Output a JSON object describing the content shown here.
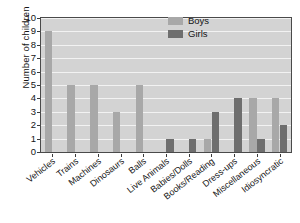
{
  "chart_data": {
    "type": "bar",
    "title": "",
    "xlabel": "",
    "ylabel": "Number of children",
    "ylim": [
      0,
      10
    ],
    "ytick_labels": [
      "0",
      "1",
      "2",
      "3",
      "4",
      "5",
      "6",
      "7",
      "8",
      "9",
      "10"
    ],
    "grid": true,
    "legend_position": "top-right",
    "categories": [
      "Vehicles",
      "Trains",
      "Machines",
      "Dinosaurs",
      "Balls",
      "Live Animals",
      "Babies/Dolls",
      "Books/Reading",
      "Dress-ups",
      "Miscellaneous",
      "Idiosyncratic"
    ],
    "series": [
      {
        "name": "Boys",
        "color": "#a8a8a8",
        "values": [
          9,
          5,
          5,
          3,
          5,
          0,
          0,
          1,
          0,
          4,
          4
        ]
      },
      {
        "name": "Girls",
        "color": "#6e6e6e",
        "values": [
          0,
          0,
          0,
          0,
          0,
          1,
          1,
          3,
          4,
          1,
          2
        ]
      }
    ]
  },
  "legend": {
    "entries": [
      {
        "label": "Boys",
        "swatch": "boys-swatch"
      },
      {
        "label": "Girls",
        "swatch": "girls-swatch"
      }
    ]
  },
  "colors": {
    "boys": "#a8a8a8",
    "girls": "#6e6e6e",
    "plot_background": "#d3d3d3",
    "gridline": "#f2f2f2",
    "axis": "#4a4a4a",
    "text": "#141414"
  }
}
